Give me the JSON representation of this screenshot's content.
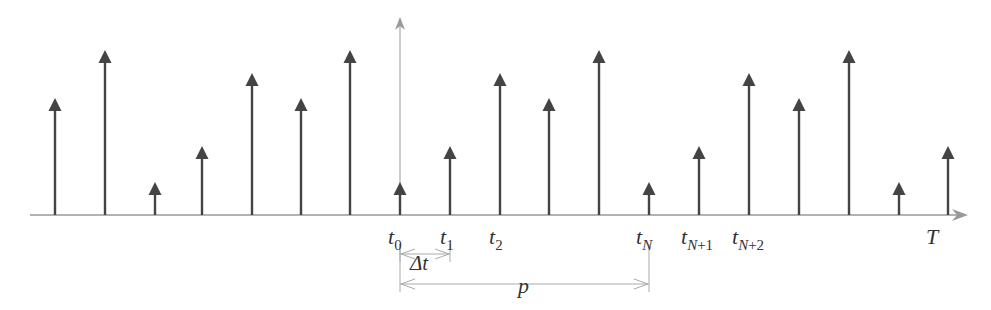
{
  "diagram": {
    "type": "impulse-train",
    "baseline_y": 215,
    "axis_x": 400,
    "axis_top_y": 17,
    "axis_end_x": 968,
    "colors": {
      "stem": "#444444",
      "axis": "#999999",
      "dim": "#aaaaaa",
      "text": "#333333"
    },
    "stems": [
      {
        "x": 55,
        "tip_y": 98
      },
      {
        "x": 105,
        "tip_y": 50
      },
      {
        "x": 155,
        "tip_y": 182
      },
      {
        "x": 202,
        "tip_y": 146
      },
      {
        "x": 252,
        "tip_y": 73
      },
      {
        "x": 301,
        "tip_y": 98
      },
      {
        "x": 350,
        "tip_y": 50
      },
      {
        "x": 400,
        "tip_y": 182
      },
      {
        "x": 450,
        "tip_y": 146
      },
      {
        "x": 500,
        "tip_y": 73
      },
      {
        "x": 549,
        "tip_y": 98
      },
      {
        "x": 599,
        "tip_y": 50
      },
      {
        "x": 649,
        "tip_y": 182
      },
      {
        "x": 699,
        "tip_y": 146
      },
      {
        "x": 749,
        "tip_y": 73
      },
      {
        "x": 799,
        "tip_y": 98
      },
      {
        "x": 849,
        "tip_y": 50
      },
      {
        "x": 899,
        "tip_y": 182
      },
      {
        "x": 948,
        "tip_y": 146
      }
    ],
    "labels": {
      "t0": {
        "base": "t",
        "sub": "0"
      },
      "t1": {
        "base": "t",
        "sub": "1"
      },
      "t2": {
        "base": "t",
        "sub": "2"
      },
      "tN": {
        "base": "t",
        "sub": "N"
      },
      "tN1": {
        "base": "t",
        "sub_var": "N",
        "sub_rest": "+1"
      },
      "tN2": {
        "base": "t",
        "sub_var": "N",
        "sub_rest": "+2"
      },
      "T": "T",
      "delta_t": "Δt",
      "p": "p"
    }
  }
}
